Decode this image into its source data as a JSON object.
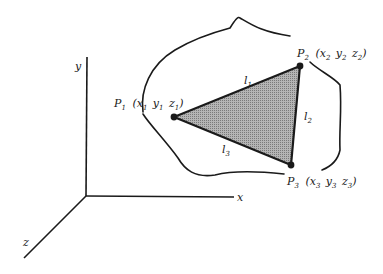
{
  "diagram": {
    "colors": {
      "stroke": "#1a1a1a",
      "fill": "#9a9a9a",
      "background": "#ffffff"
    },
    "axes": {
      "x_label": "x",
      "y_label": "y",
      "z_label": "z"
    },
    "points": [
      {
        "name": "P",
        "index": "1",
        "coords": [
          {
            "v": "x",
            "s": "1"
          },
          {
            "v": "y",
            "s": "1"
          },
          {
            "v": "z",
            "s": "1"
          }
        ]
      },
      {
        "name": "P",
        "index": "2",
        "coords": [
          {
            "v": "x",
            "s": "2"
          },
          {
            "v": "y",
            "s": "2"
          },
          {
            "v": "z",
            "s": "2"
          }
        ]
      },
      {
        "name": "P",
        "index": "3",
        "coords": [
          {
            "v": "x",
            "s": "3"
          },
          {
            "v": "y",
            "s": "3"
          },
          {
            "v": "z",
            "s": "3"
          }
        ]
      }
    ],
    "edges": [
      {
        "name": "l",
        "index": "1"
      },
      {
        "name": "l",
        "index": "2"
      },
      {
        "name": "l",
        "index": "3"
      }
    ],
    "punct": {
      "open": "(",
      "close": ")"
    }
  }
}
